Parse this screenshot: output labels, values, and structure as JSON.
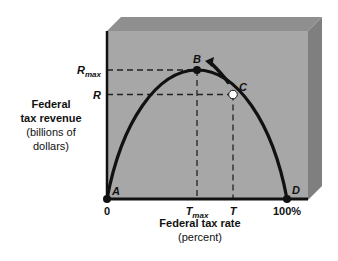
{
  "chart_data": {
    "type": "line",
    "title": "",
    "xlabel": "Federal tax rate",
    "xlabel_sub": "(percent)",
    "ylabel_lines": [
      "Federal",
      "tax revenue"
    ],
    "ylabel_sub_lines": [
      "(billions of",
      "dollars)"
    ],
    "x_ticks": [
      {
        "label": "0",
        "value": 0
      },
      {
        "label": "T",
        "sub": "max",
        "value": 50
      },
      {
        "label": "T",
        "value": 70
      },
      {
        "label": "100%",
        "value": 100
      }
    ],
    "y_ticks": [
      {
        "label": "R",
        "sub": "max",
        "value": 100
      },
      {
        "label": "R",
        "value": 81
      }
    ],
    "xlim": [
      0,
      100
    ],
    "ylim": [
      0,
      100
    ],
    "curve": "inverted parabola (Laffer curve) from A through B (peak) to D",
    "points": [
      {
        "name": "A",
        "x": 0,
        "y": 0,
        "style": "filled"
      },
      {
        "name": "B",
        "x": 50,
        "y": 100,
        "style": "filled"
      },
      {
        "name": "C",
        "x": 70,
        "y": 81,
        "style": "open"
      },
      {
        "name": "D",
        "x": 100,
        "y": 0,
        "style": "filled"
      }
    ],
    "annotations": [
      "arrow from C toward B along curve",
      "dashed guide lines from B and C to both axes"
    ],
    "grid": false
  },
  "colors": {
    "plot_face": "#a7a7a7",
    "bevel_top": "#8f8f8f",
    "bevel_side": "#7f7f7f",
    "curve": "#111111"
  }
}
